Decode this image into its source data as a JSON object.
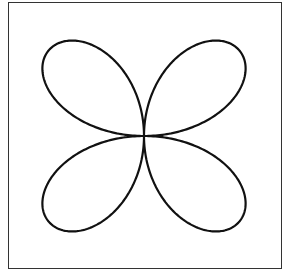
{
  "figure": {
    "curve": {
      "name": "four-leaf rose",
      "equation": "r = sin(2θ)",
      "petals": 4,
      "stroke_color": "#111111",
      "stroke_width": 2.2
    },
    "frame": {
      "border_color": "#333333"
    },
    "center": {
      "x": 144,
      "y": 136
    },
    "scale_x": 132,
    "scale_y": 124
  }
}
